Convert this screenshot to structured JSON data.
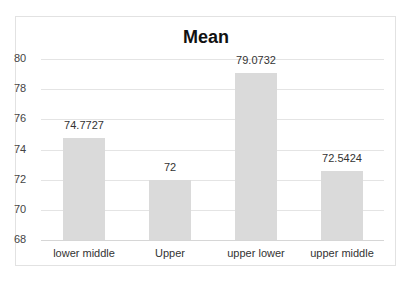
{
  "chart_data": {
    "type": "bar",
    "title": "Mean",
    "categories": [
      "lower middle",
      "Upper",
      "upper lower",
      "upper middle"
    ],
    "values": [
      74.7727,
      72,
      79.0732,
      72.5424
    ],
    "data_labels": [
      "74.7727",
      "72",
      "79.0732",
      "72.5424"
    ],
    "xlabel": "",
    "ylabel": "",
    "ylim": [
      68,
      80
    ],
    "yticks": [
      "80",
      "78",
      "76",
      "74",
      "72",
      "70",
      "68"
    ],
    "grid": true,
    "legend": "none",
    "bar_color": "#dadada"
  }
}
